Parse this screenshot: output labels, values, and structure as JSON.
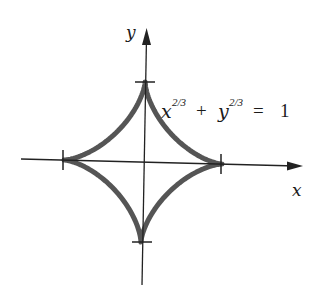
{
  "figure": {
    "equation": {
      "x_base": "x",
      "x_exp": "2/3",
      "plus": "+",
      "y_base": "y",
      "y_exp": "2/3",
      "equals": "=",
      "rhs": "1"
    },
    "axes": {
      "x_label": "x",
      "y_label": "y"
    },
    "colors": {
      "curve": "#555555",
      "axis": "#222222",
      "background": "#ffffff"
    }
  },
  "chart_data": {
    "type": "line",
    "xlabel": "x",
    "ylabel": "y",
    "xlim": [
      -1.5,
      1.5
    ],
    "ylim": [
      -1.5,
      1.5
    ],
    "grid": false,
    "ticks": {
      "x": [
        -1,
        1
      ],
      "y": [
        -1,
        1
      ]
    },
    "series": [
      {
        "name": "astroid",
        "equation": "x^(2/3) + y^(2/3) = 1",
        "parametric": "x = cos^3(t), y = sin^3(t)",
        "points": [
          [
            1,
            0
          ],
          [
            0.65,
            0.05
          ],
          [
            0.35,
            0.2
          ],
          [
            0.125,
            0.5
          ],
          [
            0,
            1
          ],
          [
            -0.125,
            0.5
          ],
          [
            -0.35,
            0.2
          ],
          [
            -0.65,
            0.05
          ],
          [
            -1,
            0
          ],
          [
            -0.65,
            -0.05
          ],
          [
            -0.35,
            -0.2
          ],
          [
            -0.125,
            -0.5
          ],
          [
            0,
            -1
          ],
          [
            0.125,
            -0.5
          ],
          [
            0.35,
            -0.2
          ],
          [
            0.65,
            -0.05
          ],
          [
            1,
            0
          ]
        ]
      }
    ]
  }
}
